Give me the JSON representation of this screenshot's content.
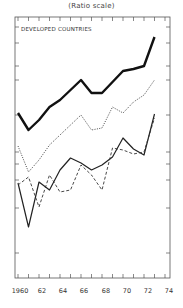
{
  "chart_data": {
    "type": "line",
    "title": "(Ratio scale)",
    "annotation": "DEVELOPED COUNTRIES",
    "xlabel": "",
    "ylabel": "",
    "y_scale": "log (ratio scale), unlabeled",
    "x": [
      1960,
      1961,
      1962,
      1963,
      1964,
      1965,
      1966,
      1967,
      1968,
      1969,
      1970,
      1971,
      1972,
      1973
    ],
    "x_tick_labels": [
      "1960",
      "62",
      "64",
      "66",
      "68",
      "70",
      "72",
      "74"
    ],
    "xlim": [
      1960,
      1974
    ],
    "grid": false,
    "legend": "none",
    "series": [
      {
        "name": "series-1 (thick solid)",
        "style": "thick-solid",
        "values": [
          113,
          130,
          120,
          107,
          100,
          90,
          80,
          93,
          93,
          82,
          71,
          69,
          66,
          37
        ]
      },
      {
        "name": "series-2 (dotted)",
        "style": "dotted",
        "values": [
          146,
          172,
          160,
          145,
          135,
          125,
          115,
          130,
          128,
          107,
          113,
          102,
          95,
          80
        ]
      },
      {
        "name": "series-3 (thin solid)",
        "style": "thin-solid",
        "values": [
          183,
          227,
          182,
          190,
          170,
          158,
          163,
          170,
          165,
          157,
          138,
          149,
          155,
          114
        ]
      },
      {
        "name": "series-4 (dashed)",
        "style": "dashed",
        "values": [
          185,
          177,
          207,
          175,
          192,
          190,
          165,
          175,
          190,
          148,
          150,
          154,
          152,
          118
        ]
      }
    ],
    "value_note": "values are relative vertical positions (smaller = higher on ratio scale); no y tick labels are shown"
  },
  "header": {
    "title": "(Ratio scale)"
  },
  "plot": {
    "region_label": "DEVELOPED COUNTRIES",
    "x_ticks": [
      {
        "label": "1960",
        "x": 20
      },
      {
        "label": "62",
        "x": 42
      },
      {
        "label": "64",
        "x": 63
      },
      {
        "label": "66",
        "x": 84
      },
      {
        "label": "68",
        "x": 106
      },
      {
        "label": "70",
        "x": 127
      },
      {
        "label": "72",
        "x": 148
      },
      {
        "label": "74",
        "x": 169
      }
    ]
  }
}
